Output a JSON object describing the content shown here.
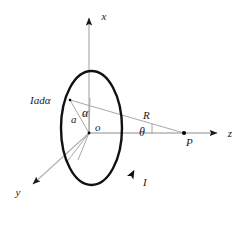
{
  "figure": {
    "background_color": "#ffffff",
    "width": 247,
    "height": 229
  },
  "colors": {
    "loop_stroke": "#111111",
    "axis_stroke": "#b3b3b3",
    "construction_stroke": "#a8a8a8",
    "label_color": "#1a1a1a",
    "point_fill": "#000000"
  },
  "axes": [
    {
      "id": "x-axis",
      "label": "x",
      "direction": "up",
      "label_x": 104,
      "label_y": 20
    },
    {
      "id": "y-axis",
      "label": "y",
      "direction": "down-left",
      "label_x": 18,
      "label_y": 196
    },
    {
      "id": "z-axis",
      "label": "z",
      "direction": "right",
      "label_x": 230,
      "label_y": 137
    }
  ],
  "origin": {
    "label": "o",
    "label_x": 95,
    "label_y": 131,
    "x": 89,
    "y": 133
  },
  "loop": {
    "element_label": "Iadα",
    "element_label_x": 30,
    "element_label_y": 104,
    "radius_label": "a",
    "radius_label_x": 71,
    "radius_label_y": 123,
    "angle_label": "α",
    "angle_label_x": 82,
    "angle_label_y": 117,
    "current_label": "I",
    "current_label_x": 143,
    "current_label_y": 186,
    "current_direction": "counterclockwise"
  },
  "field_point": {
    "label": "P",
    "label_x": 186,
    "label_y": 146,
    "x": 184,
    "y": 133
  },
  "distance": {
    "label": "R",
    "label_x": 143,
    "label_y": 119
  },
  "angle": {
    "label": "θ",
    "label_x": 139,
    "label_y": 136
  }
}
